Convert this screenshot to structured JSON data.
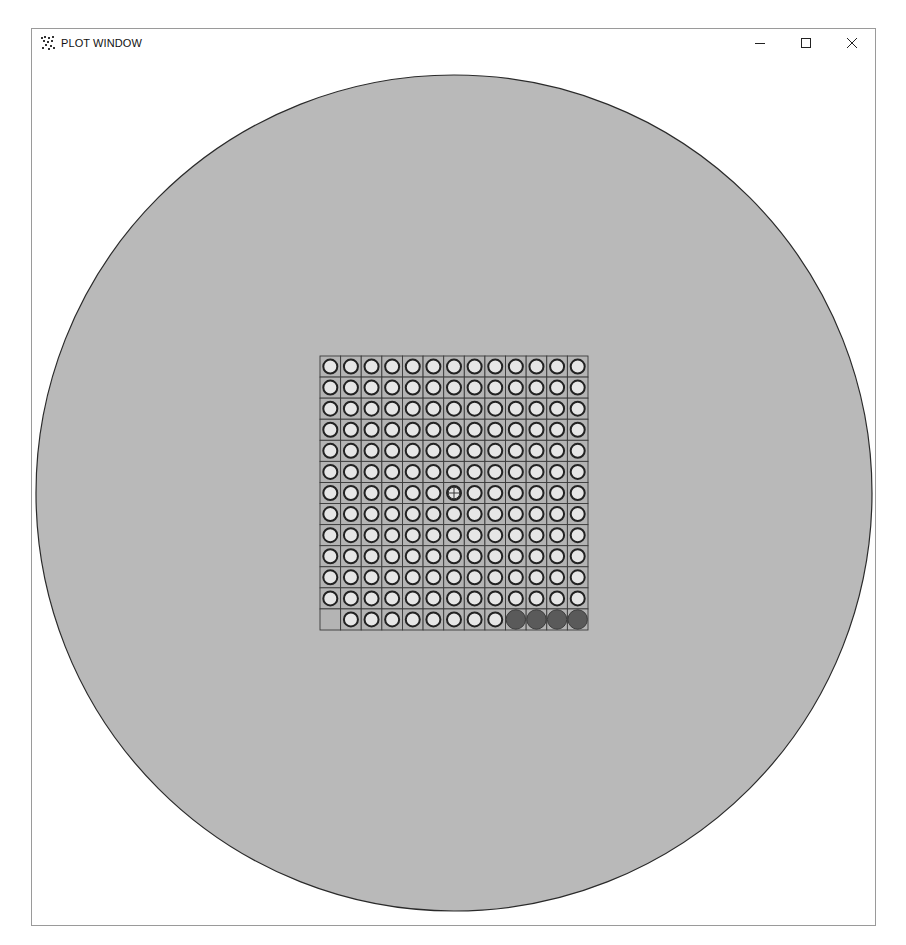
{
  "window": {
    "title": "PLOT WINDOW",
    "icon": "plot-app-icon",
    "controls": [
      {
        "name": "minimize",
        "icon": "minimize-icon"
      },
      {
        "name": "maximize",
        "icon": "maximize-icon"
      },
      {
        "name": "close",
        "icon": "close-icon"
      }
    ]
  },
  "plot": {
    "colors": {
      "wafer_fill": "#b9b9b9",
      "wafer_edge": "#2a2a2a",
      "cell_fill": "#b4b4b4",
      "grid_line": "#3a3a3a",
      "die_pass_fill": "#e6e6e6",
      "die_pass_ring": "#222222",
      "die_fail_fill": "#5a5a5a",
      "background": "#ffffff"
    },
    "grid": {
      "rows": 13,
      "cols": 13,
      "center_marker": {
        "row": 7,
        "col": 7,
        "icon": "crosshair-icon"
      },
      "cells": [
        "ooooooooooooo",
        "ooooooooooooo",
        "ooooooooooooo",
        "ooooooooooooo",
        "ooooooooooooo",
        "ooooooooooooo",
        "ooooooooooooo",
        "ooooooooooooo",
        "ooooooooooooo",
        "ooooooooooooo",
        "ooooooooooooo",
        "ooooooooooooo",
        ".oooooooo####"
      ],
      "legend_codes": {
        "o": "open die (light circle)",
        "#": "filled die (dark circle)",
        ".": "empty cell"
      }
    }
  }
}
